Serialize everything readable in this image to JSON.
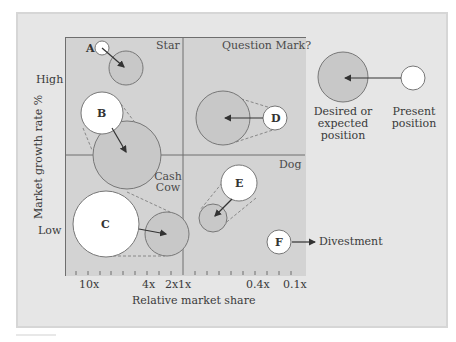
{
  "diagram": {
    "type": "BCG growth-share matrix",
    "quadrants": {
      "top_left": "Star",
      "top_right": "Question Mark?",
      "bottom_left": "Cash Cow",
      "bottom_right": "Dog"
    },
    "y_axis": {
      "label": "Market growth rate %",
      "high": "High",
      "low": "Low"
    },
    "x_axis": {
      "label": "Relative market share",
      "ticks": [
        "10x",
        "4x",
        "2x",
        "1x",
        "0.4x",
        "0.1x"
      ]
    },
    "businesses": [
      {
        "id": "A",
        "quadrant": "Star",
        "present": "small white circle",
        "desired": "larger shaded circle down-right"
      },
      {
        "id": "B",
        "quadrant": "Star",
        "present": "white circle",
        "desired": "larger shaded circle straddling Star/Cash Cow"
      },
      {
        "id": "C",
        "quadrant": "Cash Cow",
        "present": "large white circle",
        "desired": "smaller shaded circle to the right"
      },
      {
        "id": "D",
        "quadrant": "Question Mark?",
        "present": "small white circle",
        "desired": "larger shaded circle to the left"
      },
      {
        "id": "E",
        "quadrant": "Dog",
        "present": "white circle",
        "desired": "smaller shaded circle down-left"
      },
      {
        "id": "F",
        "quadrant": "Dog",
        "present": "white circle",
        "desired": "Divestment"
      }
    ],
    "divestment_label": "Divestment",
    "legend": {
      "desired_label_line1": "Desired or",
      "desired_label_line2": "expected",
      "desired_label_line3": "position",
      "present_label_line1": "Present",
      "present_label_line2": "position"
    },
    "colors": {
      "panel_bg": "#e6e6e6",
      "plot_bg": "#d3d3d3",
      "shaded_circle": "#c8c8c8",
      "present_circle": "#ffffff",
      "line": "#5a5a5a"
    }
  }
}
